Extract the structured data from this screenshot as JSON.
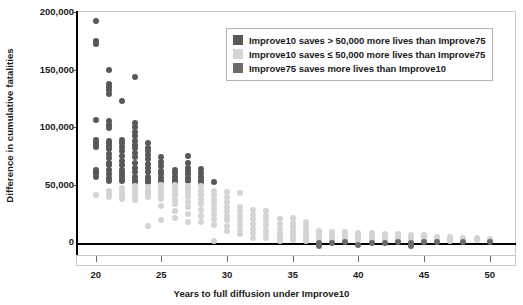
{
  "chart_data": {
    "type": "scatter",
    "title": "",
    "xlabel": "Years to full diffusion under Improve10",
    "ylabel": "Difference in cumulative fatalities",
    "xlim": [
      18.5,
      52
    ],
    "ylim": [
      -12000,
      200000
    ],
    "xticks": [
      20,
      25,
      30,
      35,
      40,
      45,
      50
    ],
    "xtick_labels": [
      "20",
      "25",
      "30",
      "35",
      "40",
      "45",
      "50"
    ],
    "yticks": [
      0,
      50000,
      100000,
      150000,
      200000
    ],
    "ytick_labels": [
      "0",
      "50,000",
      "100,000",
      "150,000",
      "200,000"
    ],
    "grid": false,
    "zero_line": true,
    "legend_position": "top-right",
    "colors": {
      "dark": "#585858",
      "light": "#d4d4d4",
      "medium_dark": "#6b6b6b",
      "axis": "#000000",
      "frame": "#c8c8c8",
      "text": "#1a1a1a"
    },
    "legend": [
      {
        "label": "Improve10 saves > 50,000 more lives than Improve75",
        "color": "#585858",
        "series": "dark"
      },
      {
        "label": "Improve10 saves ≤ 50,000 more lives than Improve75",
        "color": "#d4d4d4",
        "series": "light"
      },
      {
        "label": "Improve75 saves more lives than Improve10",
        "color": "#6b6b6b",
        "series": "medium_dark"
      }
    ],
    "series": [
      {
        "name": "Improve10 saves > 50,000 more lives than Improve75",
        "color": "#585858",
        "points": [
          [
            20,
            191000
          ],
          [
            20,
            174000
          ],
          [
            20,
            171000
          ],
          [
            20,
            105000
          ],
          [
            20,
            88000
          ],
          [
            20,
            86000
          ],
          [
            20,
            84000
          ],
          [
            20,
            82000
          ],
          [
            20,
            62000
          ],
          [
            20,
            60000
          ],
          [
            20,
            58000
          ],
          [
            20,
            56000
          ],
          [
            21,
            149000
          ],
          [
            21,
            137000
          ],
          [
            21,
            134000
          ],
          [
            21,
            131000
          ],
          [
            21,
            128000
          ],
          [
            21,
            104000
          ],
          [
            21,
            101000
          ],
          [
            21,
            98000
          ],
          [
            21,
            87000
          ],
          [
            21,
            85000
          ],
          [
            21,
            83000
          ],
          [
            21,
            80000
          ],
          [
            21,
            76000
          ],
          [
            21,
            72000
          ],
          [
            21,
            68000
          ],
          [
            21,
            66000
          ],
          [
            21,
            62000
          ],
          [
            21,
            58000
          ],
          [
            21,
            55000
          ],
          [
            21,
            52000
          ],
          [
            22,
            122000
          ],
          [
            22,
            88000
          ],
          [
            22,
            85000
          ],
          [
            22,
            82000
          ],
          [
            22,
            78000
          ],
          [
            22,
            74000
          ],
          [
            22,
            70000
          ],
          [
            22,
            66000
          ],
          [
            22,
            62000
          ],
          [
            22,
            59000
          ],
          [
            22,
            57000
          ],
          [
            22,
            54000
          ],
          [
            22,
            52000
          ],
          [
            23,
            143000
          ],
          [
            23,
            103000
          ],
          [
            23,
            99000
          ],
          [
            23,
            95000
          ],
          [
            23,
            91000
          ],
          [
            23,
            87000
          ],
          [
            23,
            84000
          ],
          [
            23,
            81000
          ],
          [
            23,
            77000
          ],
          [
            23,
            73000
          ],
          [
            23,
            68000
          ],
          [
            23,
            64000
          ],
          [
            23,
            60000
          ],
          [
            23,
            56000
          ],
          [
            23,
            53000
          ],
          [
            23,
            51000
          ],
          [
            24,
            85000
          ],
          [
            24,
            81000
          ],
          [
            24,
            78000
          ],
          [
            24,
            75000
          ],
          [
            24,
            71000
          ],
          [
            24,
            67000
          ],
          [
            24,
            64000
          ],
          [
            24,
            60000
          ],
          [
            24,
            56000
          ],
          [
            24,
            53000
          ],
          [
            24,
            51000
          ],
          [
            25,
            73000
          ],
          [
            25,
            69000
          ],
          [
            25,
            65000
          ],
          [
            25,
            61000
          ],
          [
            25,
            58000
          ],
          [
            25,
            55000
          ],
          [
            25,
            52000
          ],
          [
            26,
            62000
          ],
          [
            26,
            59000
          ],
          [
            26,
            56000
          ],
          [
            26,
            53000
          ],
          [
            26,
            51000
          ],
          [
            27,
            74000
          ],
          [
            27,
            68000
          ],
          [
            27,
            64000
          ],
          [
            27,
            61000
          ],
          [
            27,
            58000
          ],
          [
            27,
            55000
          ],
          [
            27,
            52000
          ],
          [
            28,
            63000
          ],
          [
            28,
            59000
          ],
          [
            28,
            56000
          ],
          [
            28,
            53000
          ],
          [
            28,
            51000
          ],
          [
            29,
            51000
          ]
        ]
      },
      {
        "name": "Improve10 saves ≤ 50,000 more lives than Improve75",
        "color": "#d4d4d4",
        "points": [
          [
            20,
            40000
          ],
          [
            21,
            44000
          ],
          [
            21,
            41000
          ],
          [
            21,
            38000
          ],
          [
            22,
            46000
          ],
          [
            22,
            43000
          ],
          [
            22,
            40000
          ],
          [
            22,
            37000
          ],
          [
            23,
            48000
          ],
          [
            23,
            45000
          ],
          [
            23,
            42000
          ],
          [
            23,
            39000
          ],
          [
            23,
            36000
          ],
          [
            24,
            47000
          ],
          [
            24,
            44000
          ],
          [
            24,
            41000
          ],
          [
            24,
            38000
          ],
          [
            24,
            13000
          ],
          [
            25,
            49000
          ],
          [
            25,
            46000
          ],
          [
            25,
            43000
          ],
          [
            25,
            40000
          ],
          [
            25,
            37000
          ],
          [
            25,
            31000
          ],
          [
            25,
            18000
          ],
          [
            26,
            49000
          ],
          [
            26,
            46000
          ],
          [
            26,
            43000
          ],
          [
            26,
            40000
          ],
          [
            26,
            36000
          ],
          [
            26,
            32000
          ],
          [
            26,
            26000
          ],
          [
            26,
            20000
          ],
          [
            27,
            48000
          ],
          [
            27,
            45000
          ],
          [
            27,
            42000
          ],
          [
            27,
            38000
          ],
          [
            27,
            34000
          ],
          [
            27,
            30000
          ],
          [
            27,
            24000
          ],
          [
            27,
            17000
          ],
          [
            28,
            48000
          ],
          [
            28,
            44000
          ],
          [
            28,
            40000
          ],
          [
            28,
            36000
          ],
          [
            28,
            32000
          ],
          [
            28,
            27000
          ],
          [
            28,
            22000
          ],
          [
            28,
            17000
          ],
          [
            29,
            44000
          ],
          [
            29,
            40000
          ],
          [
            29,
            36000
          ],
          [
            29,
            32000
          ],
          [
            29,
            28000
          ],
          [
            29,
            24000
          ],
          [
            29,
            19000
          ],
          [
            29,
            14000
          ],
          [
            29,
            0
          ],
          [
            30,
            43000
          ],
          [
            30,
            38000
          ],
          [
            30,
            34000
          ],
          [
            30,
            30000
          ],
          [
            30,
            26000
          ],
          [
            30,
            22000
          ],
          [
            30,
            18000
          ],
          [
            30,
            13000
          ],
          [
            30,
            9000
          ],
          [
            31,
            42000
          ],
          [
            31,
            30000
          ],
          [
            31,
            26000
          ],
          [
            31,
            22000
          ],
          [
            31,
            18000
          ],
          [
            31,
            14000
          ],
          [
            31,
            10000
          ],
          [
            31,
            6000
          ],
          [
            32,
            27000
          ],
          [
            32,
            23000
          ],
          [
            32,
            19000
          ],
          [
            32,
            15000
          ],
          [
            32,
            11000
          ],
          [
            32,
            7000
          ],
          [
            32,
            3000
          ],
          [
            33,
            26000
          ],
          [
            33,
            22000
          ],
          [
            33,
            18000
          ],
          [
            33,
            14000
          ],
          [
            33,
            10000
          ],
          [
            33,
            6000
          ],
          [
            33,
            3000
          ],
          [
            34,
            19000
          ],
          [
            34,
            15000
          ],
          [
            34,
            11000
          ],
          [
            34,
            8000
          ],
          [
            34,
            5000
          ],
          [
            34,
            2000
          ],
          [
            34,
            0
          ],
          [
            35,
            20000
          ],
          [
            35,
            16000
          ],
          [
            35,
            12000
          ],
          [
            35,
            9000
          ],
          [
            35,
            6000
          ],
          [
            35,
            3000
          ],
          [
            35,
            1000
          ],
          [
            36,
            17000
          ],
          [
            36,
            13000
          ],
          [
            36,
            10000
          ],
          [
            36,
            7000
          ],
          [
            36,
            4000
          ],
          [
            36,
            2000
          ],
          [
            36,
            0
          ],
          [
            37,
            9000
          ],
          [
            37,
            6000
          ],
          [
            37,
            4000
          ],
          [
            37,
            2000
          ],
          [
            38,
            8000
          ],
          [
            38,
            5000
          ],
          [
            38,
            3000
          ],
          [
            38,
            1000
          ],
          [
            39,
            8000
          ],
          [
            39,
            5000
          ],
          [
            39,
            3000
          ],
          [
            39,
            1000
          ],
          [
            40,
            7000
          ],
          [
            40,
            5000
          ],
          [
            40,
            3000
          ],
          [
            40,
            1000
          ],
          [
            41,
            7000
          ],
          [
            41,
            5000
          ],
          [
            41,
            3000
          ],
          [
            41,
            1000
          ],
          [
            42,
            6000
          ],
          [
            42,
            4000
          ],
          [
            42,
            2000
          ],
          [
            42,
            0
          ],
          [
            43,
            6000
          ],
          [
            43,
            4000
          ],
          [
            43,
            2000
          ],
          [
            43,
            0
          ],
          [
            44,
            5000
          ],
          [
            44,
            3000
          ],
          [
            44,
            1000
          ],
          [
            45,
            5000
          ],
          [
            45,
            3000
          ],
          [
            45,
            1000
          ],
          [
            46,
            4000
          ],
          [
            46,
            2000
          ],
          [
            46,
            0
          ],
          [
            47,
            4000
          ],
          [
            47,
            2000
          ],
          [
            47,
            0
          ],
          [
            48,
            3000
          ],
          [
            48,
            1000
          ],
          [
            49,
            3000
          ],
          [
            49,
            1000
          ],
          [
            50,
            2000
          ],
          [
            50,
            0
          ]
        ]
      },
      {
        "name": "Improve75 saves more lives than Improve10",
        "color": "#6b6b6b",
        "points": [
          [
            37,
            -4000
          ],
          [
            37,
            -2000
          ],
          [
            38,
            -2000
          ],
          [
            39,
            -1000
          ],
          [
            40,
            -3000
          ],
          [
            41,
            -2000
          ],
          [
            42,
            -2000
          ],
          [
            43,
            -1000
          ],
          [
            44,
            -4000
          ],
          [
            44,
            -2000
          ],
          [
            45,
            -1000
          ],
          [
            46,
            -1000
          ],
          [
            48,
            -1000
          ],
          [
            50,
            -1000
          ]
        ]
      }
    ]
  }
}
